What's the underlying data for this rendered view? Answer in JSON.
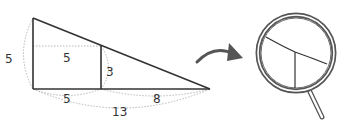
{
  "diagram": {
    "labels": {
      "left_height": "5",
      "inner_width": "5",
      "inner_height": "3",
      "bottom_left": "5",
      "bottom_right": "8",
      "bottom_total": "13"
    },
    "colors": {
      "line": "#333333",
      "dim": "#b0b0b0",
      "arrow": "#555555",
      "magnifier_rim": "#555555",
      "magnifier_fill": "#ffffff"
    },
    "icons": {
      "arrow": "curved-arrow-right",
      "magnifier": "magnifying-glass"
    }
  }
}
